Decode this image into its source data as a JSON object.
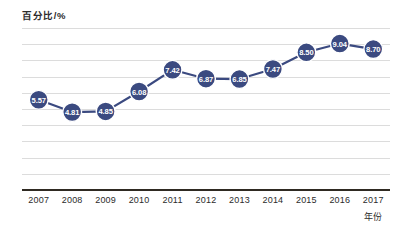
{
  "chart_data": {
    "type": "line",
    "title": "",
    "ylabel": "百分比/%",
    "xlabel": "年份",
    "categories": [
      "2007",
      "2008",
      "2009",
      "2010",
      "2011",
      "2012",
      "2013",
      "2014",
      "2015",
      "2016",
      "2017"
    ],
    "values": [
      5.57,
      4.81,
      4.85,
      6.08,
      7.42,
      6.87,
      6.85,
      7.47,
      8.5,
      9.04,
      8.7
    ],
    "point_labels": [
      "5.57",
      "4.81",
      "4.85",
      "6.08",
      "7.42",
      "6.87",
      "6.85",
      "7.47",
      "8.50",
      "9.04",
      "8.70"
    ],
    "ylim": [
      0,
      10
    ],
    "y_gridline_count": 10,
    "grid": true,
    "legend": "none",
    "series": [
      {
        "name": "百分比",
        "values": [
          5.57,
          4.81,
          4.85,
          6.08,
          7.42,
          6.87,
          6.85,
          7.47,
          8.5,
          9.04,
          8.7
        ]
      }
    ]
  },
  "style": {
    "marker_color": "#3b4a80",
    "line_color": "#3b4a80",
    "marker_edge_color": "#ffffff",
    "label_text_color": "#ffffff",
    "gridline_color": "#dcdcdc",
    "axis_color": "#2f2a22",
    "background": "#ffffff"
  }
}
